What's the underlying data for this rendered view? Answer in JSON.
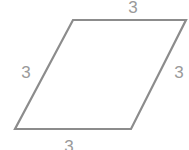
{
  "diagram": {
    "shape": "parallelogram",
    "stroke_color": "#8c8c8c",
    "label_color": "#9a9a9a",
    "vertices": [
      [
        73,
        20
      ],
      [
        186,
        20
      ],
      [
        131,
        129
      ],
      [
        15,
        129
      ]
    ],
    "side_labels": {
      "top": "3",
      "right": "3",
      "bottom": "3",
      "left": "3"
    }
  }
}
